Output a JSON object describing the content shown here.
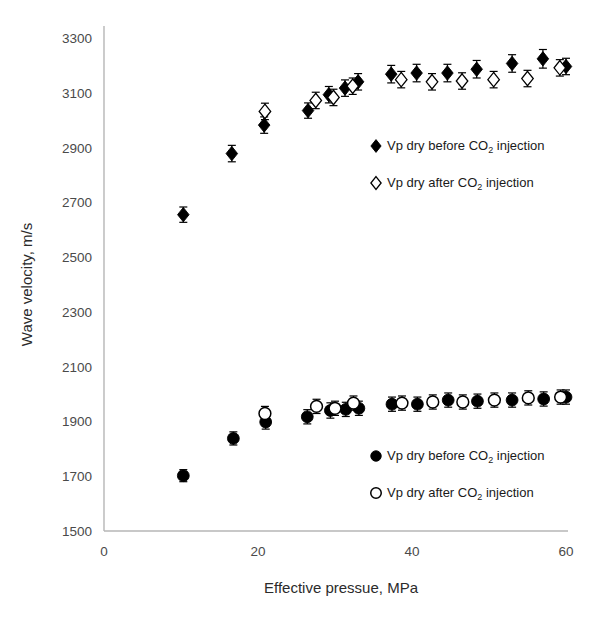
{
  "chart_data": {
    "type": "scatter",
    "title": "",
    "xlabel": "Effective pressue, MPa",
    "ylabel": "Wave velocity, m/s",
    "xlim": [
      0,
      60
    ],
    "ylim": [
      1500,
      3300
    ],
    "xticks": [
      0,
      20,
      40,
      60
    ],
    "yticks": [
      1500,
      1700,
      1900,
      2100,
      2300,
      2500,
      2700,
      2900,
      3100,
      3300
    ],
    "grid": false,
    "errorbars": true,
    "legend_position": "inside-right",
    "series": [
      {
        "name": "Vp dry before CO2 injection (upper)",
        "marker": "filled-diamond",
        "color": "#000000",
        "points": [
          {
            "x": 10.3,
            "y": 2655,
            "err": 28
          },
          {
            "x": 16.6,
            "y": 2878,
            "err": 30
          },
          {
            "x": 20.8,
            "y": 2982,
            "err": 30
          },
          {
            "x": 26.5,
            "y": 3035,
            "err": 28
          },
          {
            "x": 29.2,
            "y": 3093,
            "err": 30
          },
          {
            "x": 31.3,
            "y": 3117,
            "err": 30
          },
          {
            "x": 33.0,
            "y": 3140,
            "err": 30
          },
          {
            "x": 37.3,
            "y": 3168,
            "err": 32
          },
          {
            "x": 40.6,
            "y": 3172,
            "err": 32
          },
          {
            "x": 44.6,
            "y": 3172,
            "err": 32
          },
          {
            "x": 48.4,
            "y": 3186,
            "err": 32
          },
          {
            "x": 53.0,
            "y": 3207,
            "err": 32
          },
          {
            "x": 57.0,
            "y": 3224,
            "err": 34
          },
          {
            "x": 60.0,
            "y": 3196,
            "err": 30
          }
        ]
      },
      {
        "name": "Vp dry after CO2 injection (upper)",
        "marker": "open-diamond",
        "color": "#000000",
        "points": [
          {
            "x": 20.9,
            "y": 3032,
            "err": 30
          },
          {
            "x": 27.5,
            "y": 3072,
            "err": 30
          },
          {
            "x": 29.8,
            "y": 3083,
            "err": 30
          },
          {
            "x": 32.3,
            "y": 3124,
            "err": 30
          },
          {
            "x": 38.6,
            "y": 3148,
            "err": 30
          },
          {
            "x": 42.6,
            "y": 3140,
            "err": 30
          },
          {
            "x": 46.5,
            "y": 3143,
            "err": 30
          },
          {
            "x": 50.6,
            "y": 3148,
            "err": 30
          },
          {
            "x": 55.0,
            "y": 3152,
            "err": 30
          },
          {
            "x": 59.2,
            "y": 3191,
            "err": 30
          }
        ]
      },
      {
        "name": "Vp dry before CO2 injection (lower)",
        "marker": "filled-circle",
        "color": "#000000",
        "points": [
          {
            "x": 10.3,
            "y": 1702,
            "err": 22
          },
          {
            "x": 16.8,
            "y": 1838,
            "err": 24
          },
          {
            "x": 21.0,
            "y": 1898,
            "err": 26
          },
          {
            "x": 26.4,
            "y": 1917,
            "err": 26
          },
          {
            "x": 29.4,
            "y": 1940,
            "err": 28
          },
          {
            "x": 31.4,
            "y": 1944,
            "err": 26
          },
          {
            "x": 33.1,
            "y": 1948,
            "err": 26
          },
          {
            "x": 37.4,
            "y": 1963,
            "err": 26
          },
          {
            "x": 40.7,
            "y": 1963,
            "err": 26
          },
          {
            "x": 44.7,
            "y": 1978,
            "err": 26
          },
          {
            "x": 48.5,
            "y": 1974,
            "err": 26
          },
          {
            "x": 53.0,
            "y": 1978,
            "err": 26
          },
          {
            "x": 57.1,
            "y": 1982,
            "err": 26
          },
          {
            "x": 60.0,
            "y": 1989,
            "err": 26
          }
        ]
      },
      {
        "name": "Vp dry after CO2 injection (lower)",
        "marker": "open-circle",
        "color": "#000000",
        "points": [
          {
            "x": 20.9,
            "y": 1929,
            "err": 26
          },
          {
            "x": 27.6,
            "y": 1955,
            "err": 26
          },
          {
            "x": 30.0,
            "y": 1948,
            "err": 26
          },
          {
            "x": 32.4,
            "y": 1967,
            "err": 26
          },
          {
            "x": 38.7,
            "y": 1967,
            "err": 26
          },
          {
            "x": 42.7,
            "y": 1971,
            "err": 26
          },
          {
            "x": 46.6,
            "y": 1971,
            "err": 26
          },
          {
            "x": 50.7,
            "y": 1978,
            "err": 26
          },
          {
            "x": 55.1,
            "y": 1986,
            "err": 26
          },
          {
            "x": 59.3,
            "y": 1989,
            "err": 26
          }
        ]
      }
    ]
  },
  "legends": {
    "upper": {
      "entries": [
        {
          "marker": "filled-diamond",
          "prefix": "Vp dry before CO",
          "sub": "2",
          "suffix": " injection"
        },
        {
          "marker": "open-diamond",
          "prefix": "Vp dry after CO",
          "sub": "2",
          "suffix": " injection"
        }
      ]
    },
    "lower": {
      "entries": [
        {
          "marker": "filled-circle",
          "prefix": "Vp dry before CO",
          "sub": "2",
          "suffix": " injection"
        },
        {
          "marker": "open-circle",
          "prefix": "Vp dry after CO",
          "sub": "2",
          "suffix": " injection"
        }
      ]
    }
  },
  "colors": {
    "marker": "#000000",
    "axis": "#b6b6b6",
    "tick_text": "#4a4a4a",
    "label_text": "#2b2b2b",
    "background": "#ffffff"
  }
}
